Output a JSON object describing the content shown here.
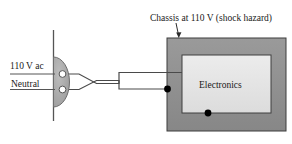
{
  "figure": {
    "title": "Chassis at 110 V (shock hazard)",
    "type": "electrical-wiring-diagram"
  },
  "caption": {
    "text": "Chassis at 110 V (shock hazard)",
    "pointer": "down-arrow-to-chassis"
  },
  "outlet": {
    "hot_label": "110 V ac",
    "neutral_label": "Neutral",
    "body_color": "#a8a8a8",
    "socket_color": "#ffffff"
  },
  "chassis": {
    "label": "Electronics",
    "frame_color": "#8c8c8c",
    "inner_color": "#e3e3e3",
    "ground_dot_color": "#000000"
  },
  "wires": {
    "style": "crossed",
    "color": "#4a4a4a",
    "hot_to_chassis": true,
    "neutral_to_inner": true
  }
}
